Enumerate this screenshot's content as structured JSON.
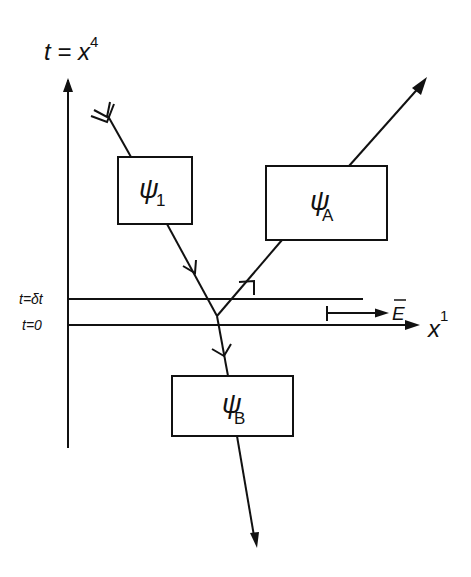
{
  "diagram": {
    "type": "spacetime-diagram",
    "axes": {
      "vertical_label": "t = x",
      "vertical_superscript": "4",
      "horizontal_label": "x",
      "horizontal_superscript": "1"
    },
    "time_lines": [
      {
        "label": "t=δt"
      },
      {
        "label": "t=0"
      }
    ],
    "field": {
      "label": "E"
    },
    "boxes": [
      {
        "id": "psi1",
        "symbol": "ψ",
        "subscript": "1"
      },
      {
        "id": "psiA",
        "symbol": "ψ",
        "subscript": "A"
      },
      {
        "id": "psiB",
        "symbol": "ψ",
        "subscript": "B"
      }
    ],
    "colors": {
      "ink": "#111111",
      "background": "#ffffff"
    }
  }
}
